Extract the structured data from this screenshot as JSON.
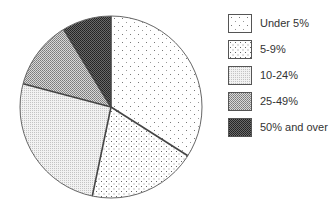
{
  "chart_data": {
    "type": "pie",
    "title": "",
    "categories": [
      "Under 5%",
      "5-9%",
      "10-24%",
      "25-49%",
      "50% and over"
    ],
    "values": [
      34.0,
      19.3,
      25.8,
      12.2,
      8.7
    ],
    "start_angle_deg": 0,
    "direction": "clockwise",
    "legend_position": "right",
    "fills": [
      "sparse-dots",
      "medium-dots",
      "fine-light-stipple",
      "medium-gray-checker",
      "dark-checker"
    ]
  },
  "legend": {
    "items": [
      {
        "label": "Under 5%",
        "pattern": "p0"
      },
      {
        "label": "5-9%",
        "pattern": "p1"
      },
      {
        "label": "10-24%",
        "pattern": "p2"
      },
      {
        "label": "25-49%",
        "pattern": "p3"
      },
      {
        "label": "50% and over",
        "pattern": "p4"
      }
    ]
  },
  "colors": {
    "outline": "#444444",
    "background": "#ffffff"
  }
}
